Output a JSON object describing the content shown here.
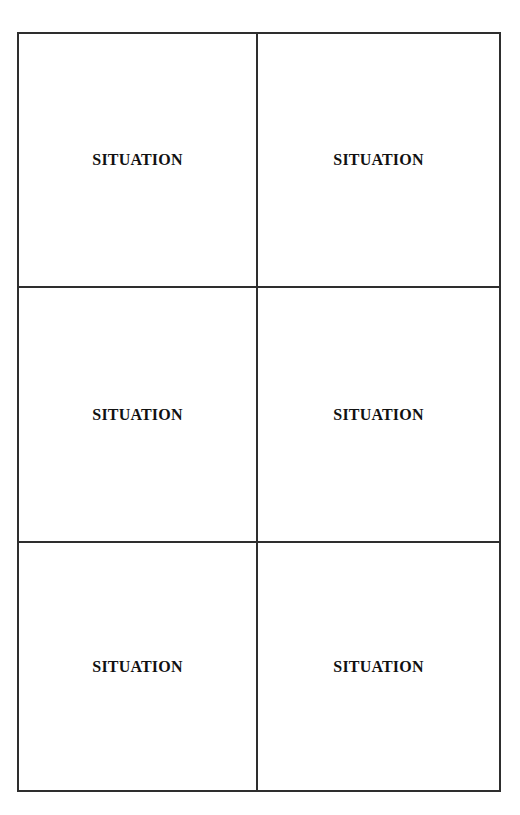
{
  "page": {
    "layout": "2x3 grid of bordered boxes",
    "border_color": "#2e2e2e",
    "text_color": "#111111",
    "background": "#ffffff"
  },
  "grid": {
    "rows": 3,
    "columns": 2,
    "cells": [
      {
        "row": 1,
        "column": 1,
        "label": "SITUATION"
      },
      {
        "row": 1,
        "column": 2,
        "label": "SITUATION"
      },
      {
        "row": 2,
        "column": 1,
        "label": "SITUATION"
      },
      {
        "row": 2,
        "column": 2,
        "label": "SITUATION"
      },
      {
        "row": 3,
        "column": 1,
        "label": "SITUATION"
      },
      {
        "row": 3,
        "column": 2,
        "label": "SITUATION"
      }
    ]
  }
}
